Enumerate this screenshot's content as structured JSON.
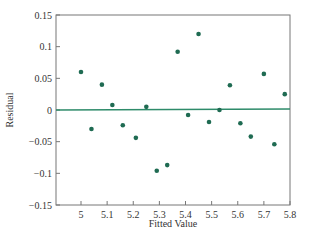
{
  "chart_data": {
    "type": "scatter",
    "title": "",
    "xlabel": "Fitted Value",
    "ylabel": "Residual",
    "xlim": [
      4.88,
      5.8
    ],
    "ylim": [
      -0.15,
      0.15
    ],
    "x_ticks": [
      5,
      5.1,
      5.2,
      5.3,
      5.4,
      5.5,
      5.6,
      5.7,
      5.8
    ],
    "x_tick_labels": [
      "5",
      "5.1",
      "5.2",
      "5.3",
      "5.4",
      "5.5",
      "5.6",
      "5.7",
      "5.8"
    ],
    "y_ticks": [
      0.15,
      0.1,
      0.05,
      0,
      -0.05,
      -0.1,
      -0.15
    ],
    "y_tick_labels": [
      "0.15",
      "0.1",
      "0.05",
      "0",
      "−0.05",
      "−0.1",
      "−0.15"
    ],
    "grid": false,
    "legend": null,
    "reference_line": {
      "y": 0,
      "color": "#2e8b6a"
    },
    "point_color": "#1f6b52",
    "series": [
      {
        "name": "Residuals",
        "x": [
          5.0,
          5.04,
          5.08,
          5.12,
          5.16,
          5.21,
          5.25,
          5.29,
          5.33,
          5.37,
          5.41,
          5.45,
          5.49,
          5.53,
          5.57,
          5.61,
          5.65,
          5.7,
          5.74,
          5.78
        ],
        "y": [
          0.06,
          -0.03,
          0.04,
          0.008,
          -0.024,
          -0.044,
          0.005,
          -0.096,
          -0.087,
          0.092,
          -0.008,
          0.12,
          -0.019,
          0.0,
          0.039,
          -0.021,
          -0.042,
          0.057,
          -0.054,
          0.025
        ]
      }
    ]
  }
}
